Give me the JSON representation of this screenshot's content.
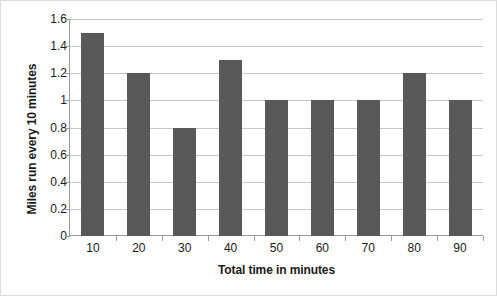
{
  "chart_data": {
    "type": "bar",
    "title": "",
    "xlabel": "Total time in minutes",
    "ylabel": "Miles run every 10 minutes",
    "categories": [
      "10",
      "20",
      "30",
      "40",
      "50",
      "60",
      "70",
      "80",
      "90"
    ],
    "values": [
      1.5,
      1.2,
      0.8,
      1.3,
      1.0,
      1.0,
      1.0,
      1.2,
      1.0
    ],
    "ylim": [
      0,
      1.6
    ],
    "yticks": [
      "0",
      "0.2",
      "0.4",
      "0.6",
      "0.8",
      "1",
      "1.2",
      "1.4",
      "1.6"
    ],
    "ytick_values": [
      0,
      0.2,
      0.4,
      0.6,
      0.8,
      1.0,
      1.2,
      1.4,
      1.6
    ],
    "grid": true,
    "legend": false,
    "legend_position": "none",
    "bar_color": "#595959",
    "gridline_color": "#c8c8c8",
    "axis_color": "#9a9a9a",
    "background_color": "#ffffff",
    "border_color": "#dcdcdc"
  }
}
